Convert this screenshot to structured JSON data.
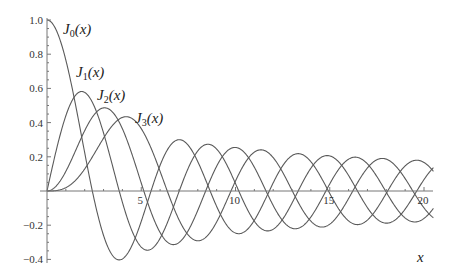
{
  "chart_data": {
    "type": "line",
    "title": "",
    "xlabel": "x",
    "ylabel": "",
    "xlim": [
      0,
      20.5
    ],
    "ylim": [
      -0.42,
      1.0
    ],
    "grid": false,
    "legend": "inline labels near curves",
    "x_ticks": [
      5,
      10,
      15,
      20
    ],
    "x_tick_labels": [
      "5",
      "10",
      "15",
      "20"
    ],
    "y_ticks": [
      -0.4,
      -0.2,
      0.2,
      0.4,
      0.6,
      0.8,
      1.0
    ],
    "y_tick_labels": [
      "−0.4",
      "−0.2",
      "0.2",
      "0.4",
      "0.6",
      "0.8",
      "1.0"
    ],
    "x": [
      0,
      1,
      2,
      3,
      4,
      5,
      6,
      7,
      8,
      9,
      10,
      11,
      12,
      13,
      14,
      15,
      16,
      17,
      18,
      19,
      20
    ],
    "series": [
      {
        "name": "J0(x)",
        "order": 0,
        "label_text": "J",
        "label_sub": "0",
        "label_suffix": "(x)",
        "values": [
          1.0,
          0.765,
          0.224,
          -0.26,
          -0.397,
          -0.178,
          0.151,
          0.3,
          0.172,
          -0.09,
          -0.246,
          -0.171,
          0.048,
          0.207,
          0.171,
          -0.014,
          -0.175,
          -0.17,
          -0.013,
          0.147,
          0.167
        ]
      },
      {
        "name": "J1(x)",
        "order": 1,
        "label_text": "J",
        "label_sub": "1",
        "label_suffix": "(x)",
        "values": [
          0.0,
          0.44,
          0.577,
          0.339,
          -0.066,
          -0.328,
          -0.277,
          -0.005,
          0.235,
          0.245,
          0.043,
          -0.177,
          -0.223,
          -0.07,
          0.133,
          0.205,
          0.09,
          -0.098,
          -0.188,
          -0.106,
          0.067
        ]
      },
      {
        "name": "J2(x)",
        "order": 2,
        "label_text": "J",
        "label_sub": "2",
        "label_suffix": "(x)",
        "values": [
          0.0,
          0.115,
          0.353,
          0.486,
          0.364,
          0.047,
          -0.243,
          -0.301,
          -0.113,
          0.145,
          0.255,
          0.139,
          -0.085,
          -0.218,
          -0.152,
          0.042,
          0.186,
          0.158,
          -0.008,
          -0.158,
          -0.16
        ]
      },
      {
        "name": "J3(x)",
        "order": 3,
        "label_text": "J",
        "label_sub": "3",
        "label_suffix": "(x)",
        "values": [
          0.0,
          0.02,
          0.129,
          0.309,
          0.43,
          0.365,
          0.115,
          -0.168,
          -0.291,
          -0.181,
          0.058,
          0.227,
          0.195,
          -0.003,
          -0.177,
          -0.194,
          -0.044,
          0.135,
          0.186,
          0.073,
          -0.099
        ]
      }
    ],
    "colors": {
      "curve": "#5a5a5a",
      "axis": "#777777"
    }
  },
  "labels": {
    "x_axis_title": "x",
    "curves": [
      {
        "text": "J",
        "sub": "0",
        "suffix": "(x)"
      },
      {
        "text": "J",
        "sub": "1",
        "suffix": "(x)"
      },
      {
        "text": "J",
        "sub": "2",
        "suffix": "(x)"
      },
      {
        "text": "J",
        "sub": "3",
        "suffix": "(x)"
      }
    ]
  }
}
